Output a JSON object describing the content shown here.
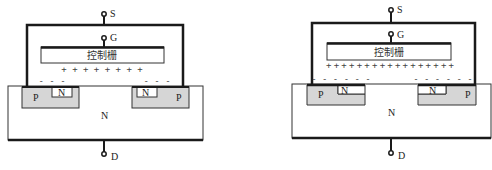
{
  "colors": {
    "line": "#1a1a1a",
    "p_region": "#d6d6d6",
    "background": "#ffffff"
  },
  "diagrams": [
    {
      "terminals": {
        "source": "S",
        "gate": "G",
        "drain": "D"
      },
      "gate_label": "控制栅",
      "substrate_label": "N",
      "left_well": {
        "p_label": "P",
        "n_label": "N"
      },
      "right_well": {
        "p_label": "P",
        "n_label": "N"
      },
      "gate_charges": "+ + + + + + + +",
      "left_charges": "- - -",
      "right_charges": "- - -"
    },
    {
      "terminals": {
        "source": "S",
        "gate": "G",
        "drain": "D"
      },
      "gate_label": "控制栅",
      "substrate_label": "N",
      "left_well": {
        "p_label": "P",
        "n_label": "N"
      },
      "right_well": {
        "p_label": "P",
        "n_label": "N"
      },
      "gate_charges": "+++++++++++++++++",
      "left_charges": "- - - - - -",
      "right_charges": "- - - - - -"
    }
  ]
}
